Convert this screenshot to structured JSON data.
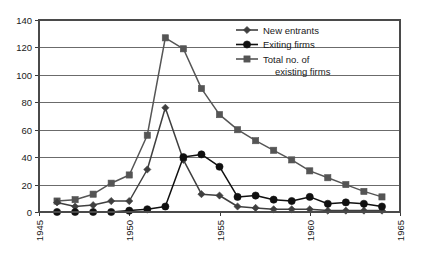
{
  "chart_data": {
    "type": "line",
    "title": "",
    "subtitle": "",
    "xlabel": "",
    "ylabel": "",
    "xlim": [
      1945,
      1965
    ],
    "ylim": [
      0,
      140
    ],
    "yticks": [
      0,
      20,
      40,
      60,
      80,
      100,
      120,
      140
    ],
    "xticks": [
      1945,
      1950,
      1955,
      1960,
      1965
    ],
    "grid": "horizontal",
    "legend_position": "top-right",
    "x": [
      1946,
      1947,
      1948,
      1949,
      1950,
      1951,
      1952,
      1953,
      1954,
      1955,
      1956,
      1957,
      1958,
      1959,
      1960,
      1961,
      1962,
      1963,
      1964
    ],
    "series": [
      {
        "name": "New entrants",
        "marker": "diamond",
        "color": "#3f3f3f",
        "values": [
          7,
          4,
          5,
          8,
          8,
          31,
          76,
          38,
          13,
          12,
          4,
          3,
          2,
          2,
          2,
          1,
          1,
          1,
          1
        ]
      },
      {
        "name": "Exiting firms",
        "marker": "circle",
        "color": "#101010",
        "values": [
          0,
          0,
          0,
          0,
          1,
          2,
          4,
          40,
          42,
          33,
          11,
          12,
          9,
          8,
          11,
          6,
          7,
          6,
          4
        ]
      },
      {
        "name": "Total no. of existing firms",
        "marker": "square",
        "color": "#555555",
        "values": [
          8,
          9,
          13,
          21,
          27,
          56,
          127,
          119,
          90,
          71,
          60,
          52,
          45,
          38,
          30,
          25,
          20,
          15,
          11
        ]
      }
    ]
  },
  "legend": {
    "items": [
      {
        "label": "New entrants",
        "marker": "diamond"
      },
      {
        "label": "Exiting firms",
        "marker": "circle"
      },
      {
        "label": "Total no. of",
        "label2": "existing firms",
        "marker": "square"
      }
    ]
  },
  "axes": {
    "y_tick_labels": [
      "0",
      "20",
      "40",
      "60",
      "80",
      "100",
      "120",
      "140"
    ],
    "x_tick_labels": [
      "1945",
      "1950",
      "1955",
      "1960",
      "1965"
    ]
  }
}
